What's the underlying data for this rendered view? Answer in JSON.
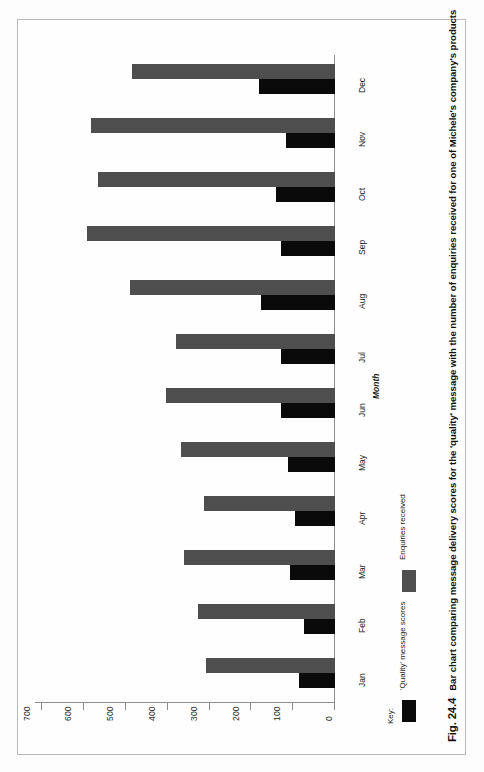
{
  "figure": {
    "number": "Fig. 24.4",
    "caption": "Bar chart comparing message delivery scores for the 'quality' message with the number of enquiries received for one of Michele's company's products"
  },
  "legend": {
    "title": "Key:",
    "items": [
      {
        "label": "'Quality' message scores",
        "color": "#0a0a0a",
        "key": "quality"
      },
      {
        "label": "Enquiries received",
        "color": "#4e4e4e",
        "key": "enquiries"
      }
    ]
  },
  "axes": {
    "category_title": "Month",
    "value_ticks": [
      "0",
      "100",
      "200",
      "300",
      "400",
      "500",
      "600",
      "700"
    ]
  },
  "chart_data": {
    "type": "bar",
    "orientation": "horizontal",
    "title": "",
    "xlabel": "",
    "ylabel": "Month",
    "ylim": [
      0,
      700
    ],
    "grid": false,
    "legend_position": "bottom-left",
    "categories": [
      "Jan",
      "Feb",
      "Mar",
      "Apr",
      "May",
      "Jun",
      "Jul",
      "Aug",
      "Sep",
      "Oct",
      "Nov",
      "Dec"
    ],
    "series": [
      {
        "name": "'Quality' message scores",
        "color": "#0a0a0a",
        "values": [
          86,
          75,
          107,
          95,
          112,
          129,
          129,
          177,
          129,
          141,
          117,
          182
        ]
      },
      {
        "name": "Enquiries received",
        "color": "#4e4e4e",
        "values": [
          309,
          328,
          361,
          313,
          368,
          404,
          380,
          490,
          593,
          567,
          584,
          486
        ]
      }
    ]
  }
}
